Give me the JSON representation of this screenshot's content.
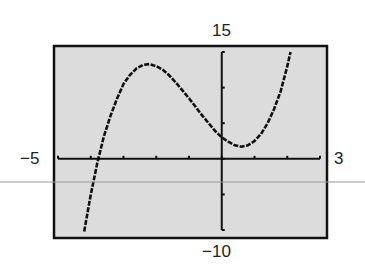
{
  "chart_data": {
    "type": "line",
    "title": "",
    "xlabel": "",
    "ylabel": "",
    "xlim": [
      -5,
      3
    ],
    "ylim": [
      -10,
      15
    ],
    "xscl": 1,
    "yscl": 5,
    "grid": false,
    "legend": null,
    "window_labels": {
      "xmin": "−5",
      "xmax": "3",
      "ymin": "−10",
      "ymax": "15"
    },
    "series": [
      {
        "name": "f(x)",
        "description": "cubic curve with local max near (-2.3, 13) and local min near (0.6, 1.7), x-intercept near -3.8, y-intercept near 3",
        "x": [
          -4.2,
          -4.0,
          -3.8,
          -3.6,
          -3.4,
          -3.2,
          -3.0,
          -2.8,
          -2.6,
          -2.4,
          -2.2,
          -2.0,
          -1.8,
          -1.6,
          -1.4,
          -1.2,
          -1.0,
          -0.8,
          -0.6,
          -0.4,
          -0.2,
          0.0,
          0.2,
          0.4,
          0.6,
          0.8,
          1.0,
          1.2,
          1.4,
          1.6,
          1.8,
          2.0,
          2.1
        ],
        "y": [
          -10.2,
          -5.0,
          -0.6,
          3.1,
          6.0,
          8.4,
          10.5,
          11.8,
          12.7,
          13.2,
          13.3,
          13.0,
          12.5,
          11.7,
          10.7,
          9.6,
          8.5,
          7.3,
          6.1,
          5.0,
          3.9,
          3.0,
          2.4,
          1.9,
          1.7,
          1.9,
          2.5,
          3.5,
          5.0,
          7.0,
          9.5,
          13.0,
          15.0
        ]
      }
    ],
    "colors": {
      "screen": "#dcdcdc",
      "frame": "#111111",
      "curve": "#111111",
      "overlay_line": "#9a9a9a"
    }
  }
}
